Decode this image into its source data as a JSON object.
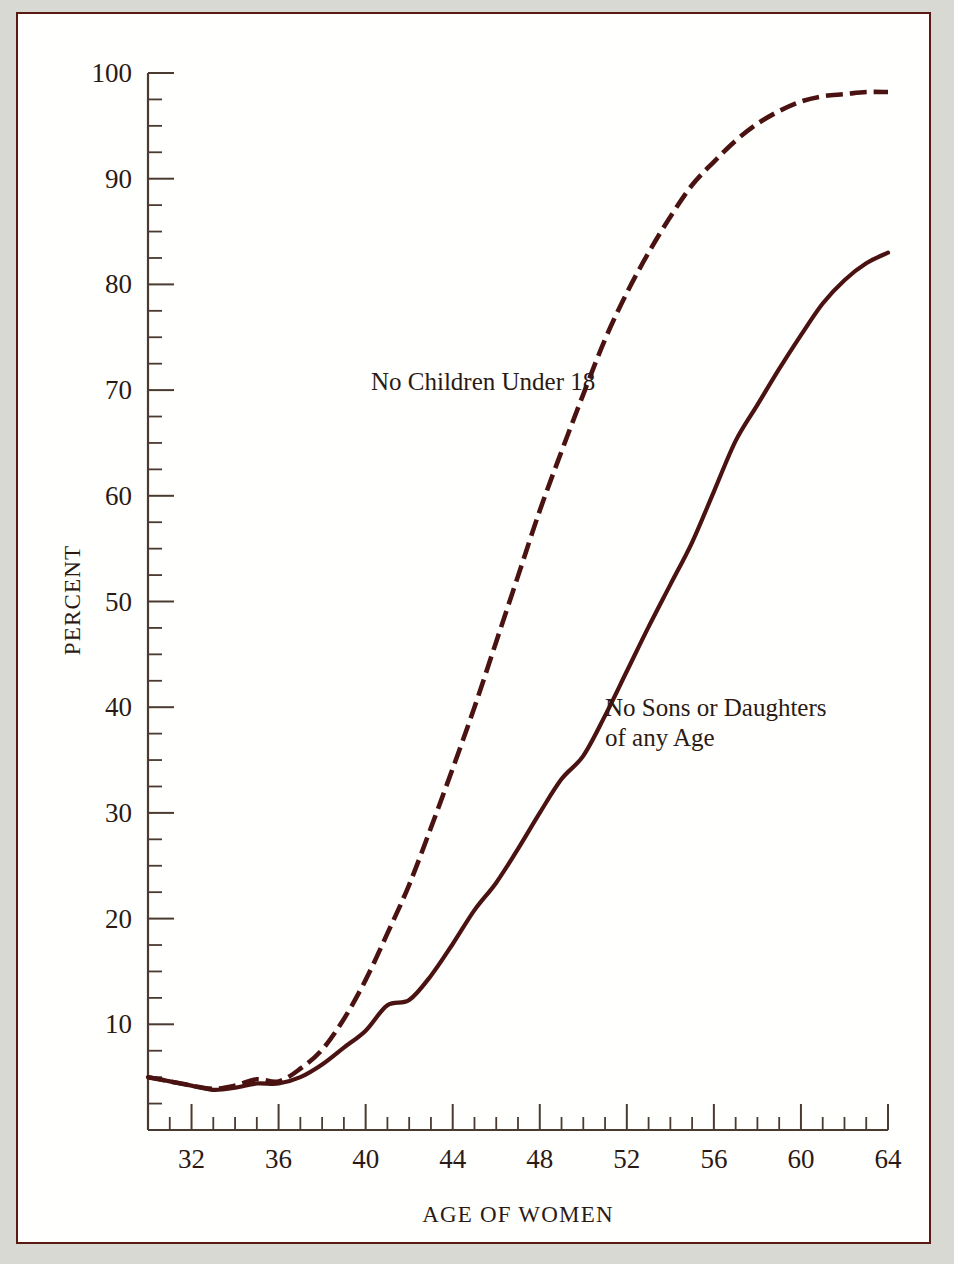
{
  "figure": {
    "background_color": "#fffffd",
    "page_color": "#d9d9d4",
    "frame_color": "#5a1a12",
    "ink_color": "#4a1210"
  },
  "axis_titles": {
    "x": "AGE OF WOMEN",
    "y": "PERCENT"
  },
  "annotations": {
    "dashed_label": "No Children Under 18",
    "solid_label_line1": "No Sons or Daughters",
    "solid_label_line2": "of  any Age"
  },
  "chart_data": {
    "type": "line",
    "title": "",
    "xlabel": "AGE OF WOMEN",
    "ylabel": "PERCENT",
    "xlim": [
      30,
      64
    ],
    "ylim": [
      0,
      100
    ],
    "grid": false,
    "legend": "inline-annotations",
    "x_ticks_major": [
      32,
      36,
      40,
      44,
      48,
      52,
      56,
      60,
      64
    ],
    "x_tick_labels": [
      "32",
      "36",
      "40",
      "44",
      "48",
      "52",
      "56",
      "60",
      "64"
    ],
    "x_tick_step_minor": 1,
    "y_ticks_major": [
      10,
      20,
      30,
      40,
      50,
      60,
      70,
      80,
      90,
      100
    ],
    "y_tick_labels": [
      "10",
      "20",
      "30",
      "40",
      "50",
      "60",
      "70",
      "80",
      "90",
      "100"
    ],
    "y_tick_step_minor": 2.5,
    "x": [
      30,
      31,
      32,
      33,
      34,
      35,
      36,
      37,
      38,
      39,
      40,
      41,
      42,
      43,
      44,
      45,
      46,
      47,
      48,
      49,
      50,
      51,
      52,
      53,
      54,
      55,
      56,
      57,
      58,
      59,
      60,
      61,
      62,
      63,
      64
    ],
    "series": [
      {
        "name": "No Children Under 18",
        "style": "dashed",
        "values": [
          5.0,
          4.6,
          4.2,
          3.9,
          4.2,
          4.8,
          4.6,
          5.8,
          7.6,
          10.5,
          14.2,
          18.6,
          23.2,
          28.6,
          34.2,
          40.0,
          46.2,
          52.4,
          58.6,
          64.2,
          69.6,
          74.8,
          79.2,
          83.0,
          86.4,
          89.4,
          91.6,
          93.6,
          95.2,
          96.4,
          97.3,
          97.8,
          98.0,
          98.2,
          98.2
        ]
      },
      {
        "name": "No Sons or Daughters of any Age",
        "style": "solid",
        "values": [
          5.0,
          4.6,
          4.2,
          3.8,
          4.0,
          4.4,
          4.4,
          5.0,
          6.2,
          7.8,
          9.4,
          11.8,
          12.3,
          14.6,
          17.6,
          20.8,
          23.4,
          26.6,
          30.0,
          33.2,
          35.4,
          39.2,
          43.4,
          47.6,
          51.6,
          55.6,
          60.4,
          65.2,
          68.6,
          72.0,
          75.2,
          78.2,
          80.4,
          82.0,
          83.0
        ]
      }
    ]
  }
}
